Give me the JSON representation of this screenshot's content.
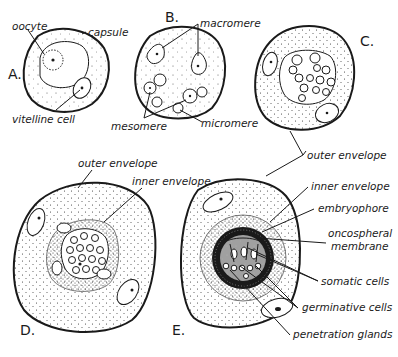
{
  "figure": {
    "panels": [
      {
        "letter": "A.",
        "labels": [
          "oocyte",
          "capsule",
          "vitelline cell"
        ]
      },
      {
        "letter": "B.",
        "labels": [
          "macromere",
          "mesomere",
          "micromere"
        ]
      },
      {
        "letter": "C.",
        "labels": [
          "outer envelope"
        ]
      },
      {
        "letter": "D.",
        "labels": [
          "outer envelope",
          "inner envelope"
        ]
      },
      {
        "letter": "E.",
        "labels": [
          "inner envelope",
          "embryophore",
          "oncospheral membrane",
          "somatic cells",
          "germinative cells",
          "penetration glands"
        ]
      }
    ]
  },
  "labels": {
    "a_letter": "A.",
    "a_oocyte": "oocyte",
    "a_capsule": "capsule",
    "a_vitelline": "vitelline cell",
    "b_letter": "B.",
    "b_macromere": "macromere",
    "b_mesomere": "mesomere",
    "b_micromere": "micromere",
    "c_letter": "C.",
    "c_outer_envelope": "outer envelope",
    "d_letter": "D.",
    "d_outer_envelope": "outer envelope",
    "d_inner_envelope": "inner envelope",
    "e_letter": "E.",
    "e_inner_envelope": "inner envelope",
    "e_embryophore": "embryophore",
    "e_oncospheral_1": "oncospheral",
    "e_oncospheral_2": "membrane",
    "e_somatic": "somatic cells",
    "e_germinative": "germinative cells",
    "e_penetration": "penetration glands"
  }
}
